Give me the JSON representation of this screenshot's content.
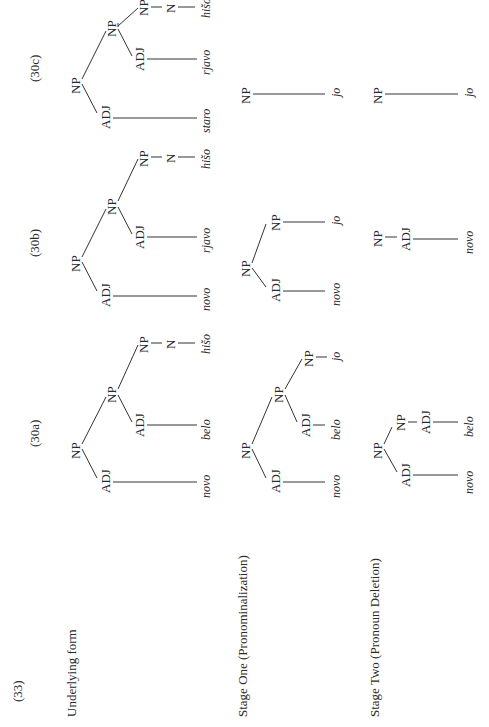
{
  "example_number": "(33)",
  "rows": [
    {
      "label": "Underlying form"
    },
    {
      "label": "Stage One (Pronominalization)"
    },
    {
      "label": "Stage Two (Pronoun Deletion)"
    }
  ],
  "columns": [
    {
      "label": "(30a)"
    },
    {
      "label": "(30b)"
    },
    {
      "label": "(30c)"
    }
  ],
  "nodes": {
    "np": "NP",
    "adj": "ADJ",
    "n": "N"
  },
  "words": {
    "a": {
      "adj1": "novo",
      "adj2": "belo",
      "noun": "hišo",
      "pron": "jo"
    },
    "b": {
      "adj1": "novo",
      "adj2": "rjavo",
      "noun": "hišo",
      "pron": "jo"
    },
    "c": {
      "adj1": "staro",
      "adj2": "rjavo",
      "noun": "hišo",
      "pron": "jo"
    }
  }
}
